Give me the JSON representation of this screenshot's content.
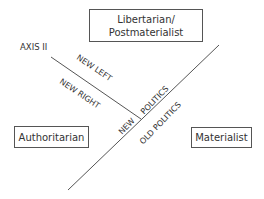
{
  "diagram": {
    "boxes": {
      "top": "Libertarian/\nPostmaterialist",
      "top_line1": "Libertarian/",
      "top_line2": "Postmaterialist",
      "left": "Authoritarian",
      "right": "Materialist"
    },
    "axis_label": "AXIS II",
    "line_labels": {
      "new_left": "NEW LEFT",
      "new_right": "NEW RIGHT",
      "new_politics_new": "NEW",
      "new_politics_politics": "POLITICS",
      "old_politics": "OLD POLITICS"
    },
    "colors": {
      "line": "#555555",
      "text": "#333333",
      "background": "#ffffff"
    }
  }
}
